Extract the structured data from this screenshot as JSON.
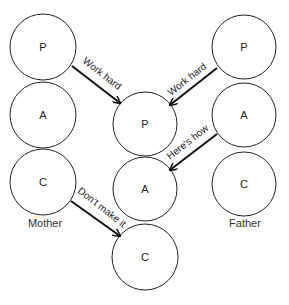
{
  "nodes": {
    "mother": {
      "caption": "Mother",
      "parent": "P",
      "adult": "A",
      "child": "C"
    },
    "child_person": {
      "parent": "P",
      "adult": "A",
      "child": "C"
    },
    "father": {
      "caption": "Father",
      "parent": "P",
      "adult": "A",
      "child": "C"
    }
  },
  "arrows": [
    {
      "from": "mother.parent",
      "to": "child_person.parent",
      "label": "Work hard"
    },
    {
      "from": "father.parent",
      "to": "child_person.parent",
      "label": "Work hard"
    },
    {
      "from": "father.adult",
      "to": "child_person.adult",
      "label": "Here's how"
    },
    {
      "from": "mother.child",
      "to": "child_person.child",
      "label": "Don't make it"
    }
  ],
  "colors": {
    "stroke": "#222222",
    "background": "#ffffff"
  }
}
